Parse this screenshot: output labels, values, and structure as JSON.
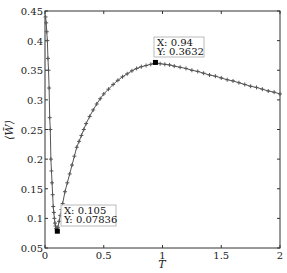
{
  "chart_data": {
    "type": "scatter",
    "title": "",
    "xlabel": "T",
    "ylabel": "⟨W̄⟩",
    "xlim": [
      0,
      2
    ],
    "ylim": [
      0.05,
      0.45
    ],
    "grid": false,
    "legend": null,
    "x_ticks": [
      0,
      0.5,
      1,
      1.5,
      2
    ],
    "x_tick_labels": [
      "0",
      "0.5",
      "1",
      "1.5",
      "2"
    ],
    "y_ticks": [
      0.05,
      0.1,
      0.15,
      0.2,
      0.25,
      0.3,
      0.35,
      0.4,
      0.45
    ],
    "y_tick_labels": [
      "0.05",
      "0.1",
      "0.15",
      "0.2",
      "0.25",
      "0.3",
      "0.35",
      "0.4",
      "0.45"
    ],
    "marker": "+",
    "series": [
      {
        "name": "⟨W̄⟩ vs T",
        "color": "#555555",
        "x": [
          0.005,
          0.01,
          0.015,
          0.02,
          0.025,
          0.03,
          0.035,
          0.04,
          0.045,
          0.05,
          0.055,
          0.06,
          0.065,
          0.07,
          0.075,
          0.08,
          0.085,
          0.09,
          0.095,
          0.1,
          0.105,
          0.11,
          0.12,
          0.13,
          0.14,
          0.15,
          0.17,
          0.19,
          0.21,
          0.23,
          0.25,
          0.27,
          0.29,
          0.31,
          0.33,
          0.35,
          0.38,
          0.41,
          0.44,
          0.47,
          0.5,
          0.54,
          0.58,
          0.62,
          0.66,
          0.7,
          0.74,
          0.78,
          0.82,
          0.86,
          0.9,
          0.94,
          0.98,
          1.02,
          1.06,
          1.1,
          1.15,
          1.2,
          1.25,
          1.3,
          1.35,
          1.4,
          1.45,
          1.5,
          1.55,
          1.6,
          1.65,
          1.7,
          1.75,
          1.8,
          1.85,
          1.9,
          1.95,
          2.0
        ],
        "y": [
          0.44,
          0.43,
          0.415,
          0.4,
          0.37,
          0.35,
          0.32,
          0.27,
          0.25,
          0.2,
          0.18,
          0.16,
          0.14,
          0.12,
          0.11,
          0.1,
          0.092,
          0.087,
          0.083,
          0.08,
          0.07836,
          0.085,
          0.095,
          0.105,
          0.115,
          0.125,
          0.145,
          0.16,
          0.175,
          0.19,
          0.205,
          0.22,
          0.23,
          0.24,
          0.25,
          0.26,
          0.272,
          0.283,
          0.293,
          0.302,
          0.31,
          0.318,
          0.326,
          0.333,
          0.339,
          0.344,
          0.349,
          0.353,
          0.356,
          0.358,
          0.36,
          0.3632,
          0.361,
          0.36,
          0.359,
          0.357,
          0.355,
          0.353,
          0.35,
          0.348,
          0.345,
          0.342,
          0.34,
          0.337,
          0.334,
          0.332,
          0.329,
          0.326,
          0.323,
          0.321,
          0.318,
          0.315,
          0.313,
          0.31
        ]
      }
    ],
    "annotations": [
      {
        "type": "datatip",
        "x": 0.94,
        "y": 0.3632,
        "x_label": "X: 0.94",
        "y_label": "Y: 0.3632"
      },
      {
        "type": "datatip",
        "x": 0.105,
        "y": 0.07836,
        "x_label": "X: 0.105",
        "y_label": "Y: 0.07836"
      }
    ]
  },
  "datatips": {
    "peak": {
      "x_text": "X: 0.94",
      "y_text": "Y: 0.3632"
    },
    "min": {
      "x_text": "X: 0.105",
      "y_text": "Y: 0.07836"
    }
  },
  "axes": {
    "xlabel": "T",
    "ylabel": "⟨W̄⟩"
  }
}
